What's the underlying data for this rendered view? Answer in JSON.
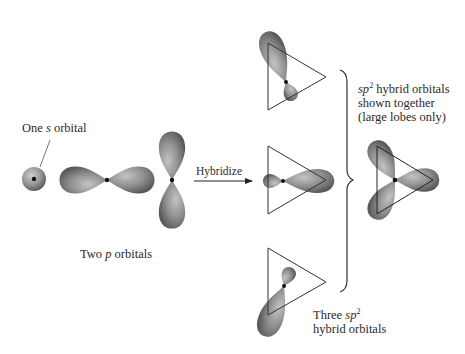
{
  "labels": {
    "s_orbital": {
      "prefix": "One ",
      "italic": "s",
      "suffix": " orbital"
    },
    "p_orbitals": {
      "prefix": "Two ",
      "italic": "p",
      "suffix": " orbitals"
    },
    "arrow": "Hybridize",
    "together": {
      "italic": "sp",
      "sup": "2",
      "line1_suffix": " hybrid orbitals",
      "line2": "shown together",
      "line3": "(large lobes only)"
    },
    "three": {
      "prefix": "Three ",
      "italic": "sp",
      "sup": "2",
      "line2": "hybrid orbitals"
    }
  },
  "colors": {
    "lobe_light": "#bdbdbd",
    "lobe_mid": "#8a8a8a",
    "lobe_dark": "#4f4f4f",
    "line": "#333333",
    "nucleus": "#111111"
  }
}
